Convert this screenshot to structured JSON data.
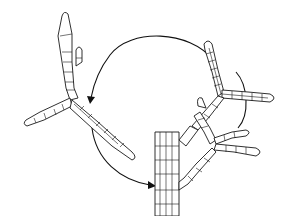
{
  "figure": {
    "type": "botanical line drawing",
    "background": "#ffffff",
    "line_color": "#1a1a1a",
    "elements": {
      "main_axis": "vertical multicellular stalk at lower center-right",
      "branch_systems": [
        "upper-left detached branch system",
        "upper-right branch system",
        "lower-right branch system attached to axis"
      ],
      "arrows": [
        "arc-arrow-top-to-left",
        "arc-arrow-left-to-bottom"
      ]
    },
    "text_labels": []
  }
}
